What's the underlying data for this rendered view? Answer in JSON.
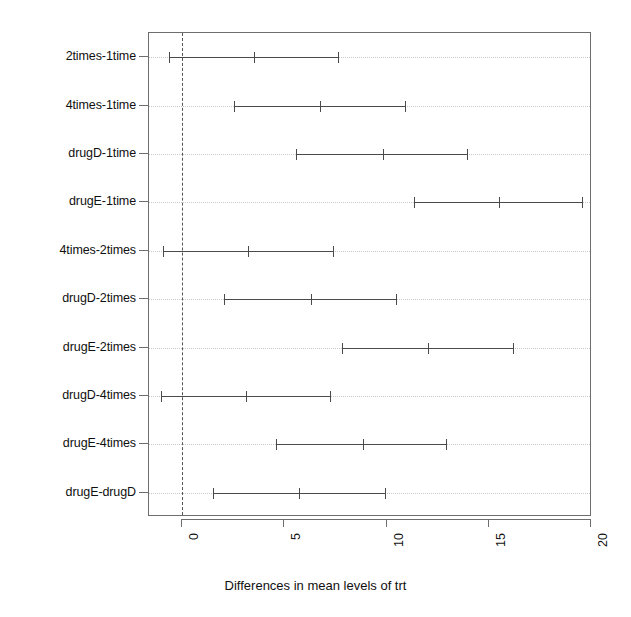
{
  "chart_data": {
    "type": "scatter",
    "title": "",
    "xlabel": "Differences in mean levels of trt",
    "ylabel": "",
    "xlim": [
      -1.8,
      20.2
    ],
    "xticks": [
      0,
      5,
      10,
      15,
      20
    ],
    "xticklabels": [
      "0",
      "5",
      "10",
      "15",
      "20"
    ],
    "grid": true,
    "legend": null,
    "reference_line": 0,
    "categories": [
      "2times-1time",
      "4times-1time",
      "drugD-1time",
      "drugE-1time",
      "4times-2times",
      "drugD-2times",
      "drugE-2times",
      "drugD-4times",
      "drugE-4times",
      "drugE-drugD"
    ],
    "series": [
      {
        "name": "diff",
        "values": [
          3.52,
          6.75,
          9.83,
          15.5,
          3.23,
          6.3,
          12.03,
          3.13,
          8.85,
          5.72
        ]
      },
      {
        "name": "lwr",
        "values": [
          -0.64,
          2.54,
          5.58,
          11.34,
          -0.93,
          2.05,
          7.82,
          -1.03,
          4.6,
          1.52
        ]
      },
      {
        "name": "upr",
        "values": [
          7.68,
          10.95,
          13.98,
          19.61,
          7.43,
          10.51,
          16.23,
          7.29,
          12.96,
          9.98
        ]
      }
    ],
    "colors": {
      "interval": "#4a4a4a",
      "reference": "#555555",
      "grid": "#c9c9c9",
      "axis": "#6e6e6e",
      "background": "#ffffff"
    }
  }
}
